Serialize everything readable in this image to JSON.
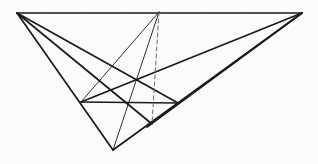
{
  "figure": {
    "canvas": {
      "width": 318,
      "height": 164
    },
    "background_color": "#fbfbf9",
    "stroke_color": "#1a1a1a",
    "dashed_stroke_color": "#6b6b6b",
    "points": {
      "left_apex": {
        "name": "A",
        "x": 17,
        "y": 13
      },
      "right_apex": {
        "name": "B",
        "x": 302,
        "y": 13
      },
      "top_mid": {
        "name": "C",
        "x": 159,
        "y": 12
      },
      "bottom_vertex": {
        "name": "D",
        "x": 113,
        "y": 150
      },
      "dash_foot": {
        "name": "E",
        "x": 152,
        "y": 124
      },
      "left_mid": {
        "name": "F",
        "x": 81,
        "y": 102
      },
      "right_mid": {
        "name": "G",
        "x": 178,
        "y": 103
      },
      "ray_end_low": {
        "name": "H",
        "x": 147,
        "y": 127
      },
      "ray_end_mid": {
        "name": "I",
        "x": 120,
        "y": 110
      }
    },
    "strokes": [
      {
        "name": "top-edge",
        "from": "left_apex",
        "to": "right_apex",
        "style": "solid",
        "weight": 1.7
      },
      {
        "name": "left-long-ray",
        "from": "left_apex",
        "to": "bottom_vertex",
        "style": "solid",
        "weight": 1.7
      },
      {
        "name": "left-ray-to-dashfoot",
        "from": "left_apex",
        "to": "dash_foot",
        "style": "solid",
        "weight": 1.7
      },
      {
        "name": "left-ray-to-rightmid",
        "from": "left_apex",
        "to": "right_mid",
        "style": "solid",
        "weight": 1.7
      },
      {
        "name": "right-long-ray",
        "from": "right_apex",
        "to": "bottom_vertex",
        "style": "solid",
        "weight": 1.7
      },
      {
        "name": "right-ray-to-leftmid",
        "from": "right_apex",
        "to": "left_mid",
        "style": "solid",
        "weight": 1.7
      },
      {
        "name": "right-ray-lower",
        "from": "right_apex",
        "to": "ray_end_low",
        "style": "solid",
        "weight": 1.7
      },
      {
        "name": "mid-horizontal",
        "from": "left_mid",
        "to": "right_mid",
        "style": "solid",
        "weight": 1.7
      },
      {
        "name": "thin-ray-to-bottom",
        "from": "top_mid",
        "to": "bottom_vertex",
        "style": "solid",
        "weight": 0.9
      },
      {
        "name": "thin-ray-to-leftmid",
        "from": "top_mid",
        "to": "left_mid",
        "style": "solid",
        "weight": 0.9
      },
      {
        "name": "dashed-vertical",
        "from": "top_mid",
        "to": "dash_foot",
        "style": "dashed",
        "weight": 1.0
      }
    ],
    "dash_pattern": "4 3"
  }
}
